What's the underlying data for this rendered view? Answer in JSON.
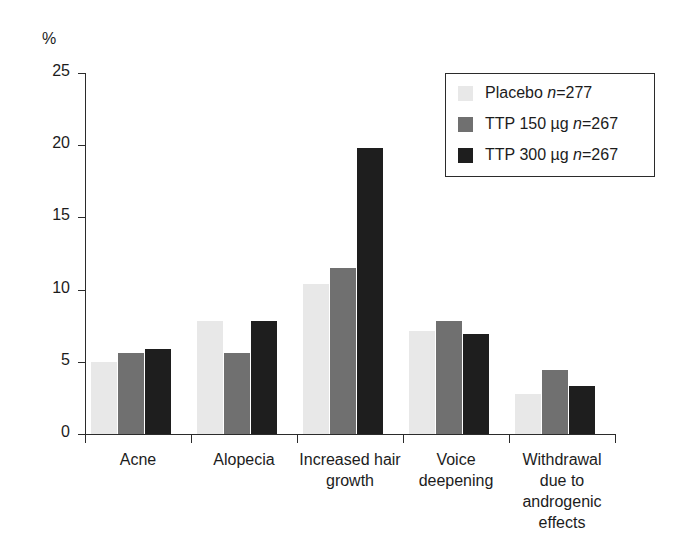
{
  "chart_data": {
    "type": "bar",
    "title": "",
    "subtitle": "",
    "xlabel": "",
    "ylabel": "%",
    "ylim": [
      0,
      25
    ],
    "yticks": [
      0,
      5,
      10,
      15,
      20,
      25
    ],
    "ytick_labels": [
      "0",
      "5",
      "10",
      "15",
      "20",
      "25"
    ],
    "grid": false,
    "legend_position": "top-right",
    "categories": [
      "Acne",
      "Alopecia",
      "Increased hair growth",
      "Voice deepening",
      "Withdrawal due to androgenic effects"
    ],
    "category_lines": [
      [
        "Acne"
      ],
      [
        "Alopecia"
      ],
      [
        "Increased hair",
        "growth"
      ],
      [
        "Voice",
        "deepening"
      ],
      [
        "Withdrawal",
        "due to",
        "androgenic",
        "effects"
      ]
    ],
    "series": [
      {
        "name": "Placebo n=277",
        "label_main": "Placebo ",
        "label_italic": "n",
        "label_tail": "=277",
        "color": "#e8e8e8",
        "values": [
          5.0,
          7.8,
          10.4,
          7.1,
          2.8
        ]
      },
      {
        "name": "TTP 150 µg n=267",
        "label_main": "TTP 150 µg ",
        "label_italic": "n",
        "label_tail": "=267",
        "color": "#707070",
        "values": [
          5.6,
          5.6,
          11.5,
          7.8,
          4.4
        ]
      },
      {
        "name": "TTP 300 µg n=267",
        "label_main": "TTP 300 µg ",
        "label_italic": "n",
        "label_tail": "=267",
        "color": "#1e1e1e",
        "values": [
          5.9,
          7.8,
          19.8,
          6.9,
          3.3
        ]
      }
    ]
  }
}
